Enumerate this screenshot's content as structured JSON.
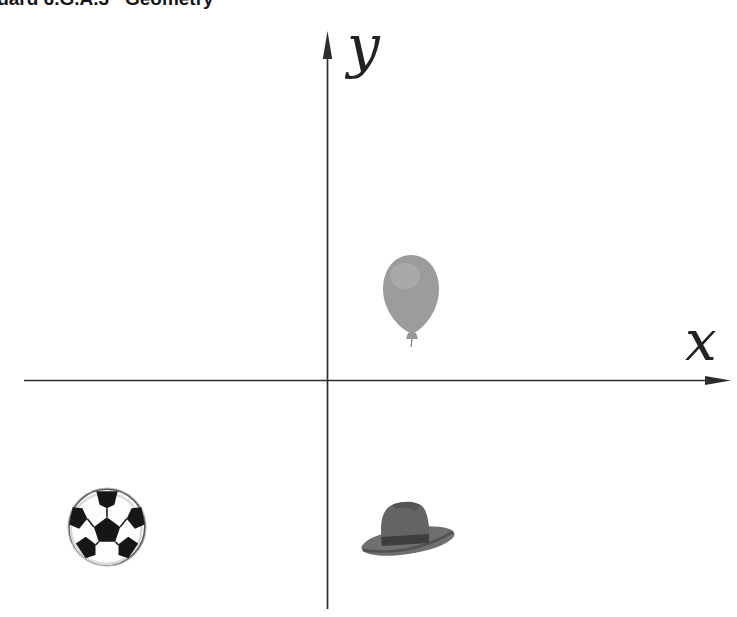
{
  "header": {
    "text": "Standard 6.G.A.3   Geometry"
  },
  "axes": {
    "x_label": "x",
    "y_label": "y",
    "color": "#2e2e2e"
  },
  "diagram": {
    "type": "coordinate-plane",
    "objects": [
      {
        "id": "balloon",
        "label": "balloon",
        "quadrant": "I"
      },
      {
        "id": "soccer-ball",
        "label": "soccer ball",
        "quadrant": "III"
      },
      {
        "id": "hat",
        "label": "hat",
        "quadrant": "IV"
      }
    ],
    "colors": {
      "balloon_gray": "#9c9c9c",
      "balloon_highlight": "#aeaeae",
      "hat_gray": "#6a6a6a",
      "hat_band": "#3e3e3e",
      "ball_black": "#161616",
      "ball_white": "#fdfdfd"
    }
  }
}
